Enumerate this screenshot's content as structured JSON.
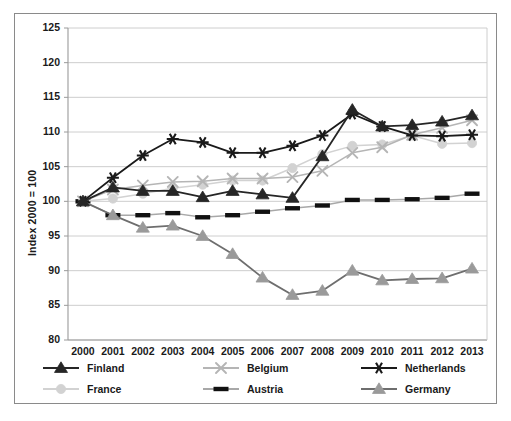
{
  "chart_data": {
    "type": "line",
    "title": "",
    "xlabel": "",
    "ylabel": "Index 2000 = 100",
    "x": [
      2000,
      2001,
      2002,
      2003,
      2004,
      2005,
      2006,
      2007,
      2008,
      2009,
      2010,
      2011,
      2012,
      2013
    ],
    "categories": [
      "2000",
      "2001",
      "2002",
      "2003",
      "2004",
      "2005",
      "2006",
      "2007",
      "2008",
      "2009",
      "2010",
      "2011",
      "2012",
      "2013"
    ],
    "ylim": [
      80,
      125
    ],
    "yticks": [
      80,
      85,
      90,
      95,
      100,
      105,
      110,
      115,
      120,
      125
    ],
    "grid": true,
    "legend_position": "bottom",
    "series": [
      {
        "name": "Finland",
        "color": "#262626",
        "marker": "triangle",
        "marker_color": "#262626",
        "values": [
          100.0,
          102.0,
          101.5,
          101.5,
          100.6,
          101.5,
          101.0,
          100.5,
          106.5,
          113.2,
          110.8,
          111.0,
          111.5,
          112.4
        ]
      },
      {
        "name": "Belgium",
        "color": "#b5b5b5",
        "marker": "x",
        "marker_color": "#b5b5b5",
        "values": [
          100.0,
          101.7,
          102.3,
          102.8,
          102.9,
          103.3,
          103.3,
          103.5,
          104.4,
          107.0,
          107.8,
          109.6,
          110.6,
          111.7
        ]
      },
      {
        "name": "Netherlands",
        "color": "#1a1a1a",
        "marker": "asterisk",
        "marker_color": "#1a1a1a",
        "values": [
          100.0,
          103.4,
          106.6,
          109.0,
          108.5,
          107.0,
          107.0,
          108.0,
          109.5,
          112.6,
          110.8,
          109.5,
          109.4,
          109.6
        ]
      },
      {
        "name": "France",
        "color": "#d2d2d2",
        "marker": "circle",
        "marker_color": "#d2d2d2",
        "values": [
          100.0,
          100.4,
          101.1,
          101.9,
          102.4,
          103.0,
          103.0,
          104.8,
          106.8,
          108.0,
          108.2,
          109.5,
          108.3,
          108.4
        ]
      },
      {
        "name": "Austria",
        "color": "#a8a8a8",
        "marker": "dash",
        "marker_color": "#111111",
        "values": [
          100.0,
          98.0,
          98.0,
          98.3,
          97.7,
          98.0,
          98.5,
          99.0,
          99.4,
          100.2,
          100.2,
          100.3,
          100.5,
          101.1
        ]
      },
      {
        "name": "Germany",
        "color": "#6e6e6e",
        "marker": "triangle",
        "marker_color": "#9a9a9a",
        "values": [
          100.0,
          98.0,
          96.2,
          96.5,
          95.0,
          92.4,
          89.0,
          86.5,
          87.1,
          90.0,
          88.6,
          88.8,
          88.9,
          90.3
        ]
      }
    ]
  },
  "axes": {
    "y_title": "Index 2000 = 100",
    "y_ticks": [
      "125",
      "120",
      "115",
      "110",
      "105",
      "100",
      "95",
      "90",
      "85",
      "80"
    ],
    "x_ticks": [
      "2000",
      "2001",
      "2002",
      "2003",
      "2004",
      "2005",
      "2006",
      "2007",
      "2008",
      "2009",
      "2010",
      "2011",
      "2012",
      "2013"
    ]
  },
  "legend": {
    "entries": [
      {
        "label": "Finland",
        "marker": "triangle-dark",
        "line_color": "#262626",
        "marker_color": "#262626"
      },
      {
        "label": "Belgium",
        "marker": "x-light",
        "line_color": "#b5b5b5",
        "marker_color": "#b5b5b5"
      },
      {
        "label": "Netherlands",
        "marker": "asterisk-dark",
        "line_color": "#1a1a1a",
        "marker_color": "#1a1a1a"
      },
      {
        "label": "France",
        "marker": "circle-light",
        "line_color": "#d2d2d2",
        "marker_color": "#d2d2d2"
      },
      {
        "label": "Austria",
        "marker": "dash-dark",
        "line_color": "#a8a8a8",
        "marker_color": "#111111"
      },
      {
        "label": "Germany",
        "marker": "triangle-gray",
        "line_color": "#6e6e6e",
        "marker_color": "#9a9a9a"
      }
    ]
  },
  "colors": {
    "frame": "#8a8a8a",
    "gridline": "#c8c8c8",
    "axis": "#9a9a9a",
    "background": "#ffffff",
    "text": "#1a1a1a"
  }
}
